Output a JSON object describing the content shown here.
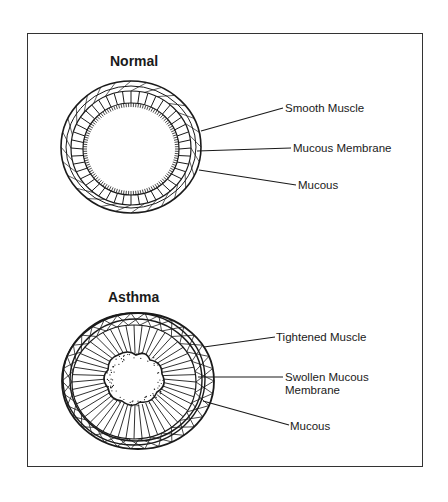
{
  "diagram": {
    "normal": {
      "title": "Normal",
      "labels": [
        {
          "text": "Smooth Muscle"
        },
        {
          "text": "Mucous Membrane"
        },
        {
          "text": "Mucous"
        }
      ]
    },
    "asthma": {
      "title": "Asthma",
      "labels": [
        {
          "text": "Tightened Muscle"
        },
        {
          "text": "Swollen Mucous",
          "line2": "Membrane"
        },
        {
          "text": "Mucous"
        }
      ]
    }
  }
}
